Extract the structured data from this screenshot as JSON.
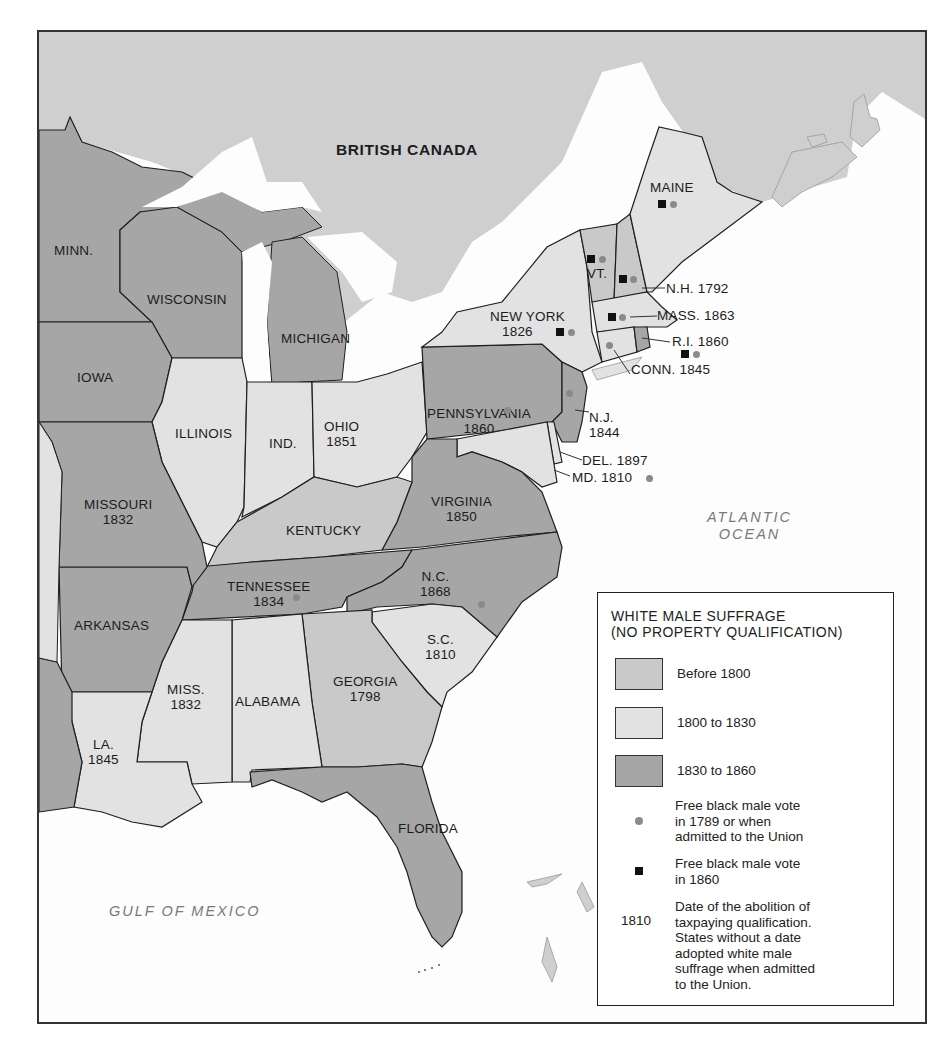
{
  "map": {
    "title": "White Male Suffrage in the United States",
    "colors": {
      "before_1800": "#c9c9c9",
      "1800_to_1830": "#e2e2e2",
      "1830_to_1860": "#a6a6a6",
      "canada": "#cfcfcf",
      "water": "#fdfdfd",
      "border": "#1f1f1f",
      "gray_dot": "#8a8a8a",
      "black_square": "#111111"
    },
    "regions": {
      "canada": "BRITISH CANADA",
      "atlantic_line1": "ATLANTIC",
      "atlantic_line2": "OCEAN",
      "gulf": "GULF OF MEXICO"
    },
    "states": [
      {
        "name": "MINN.",
        "year": "",
        "category": "1830 to 1860"
      },
      {
        "name": "WISCONSIN",
        "year": "",
        "category": "1830 to 1860"
      },
      {
        "name": "MICHIGAN",
        "year": "",
        "category": "1830 to 1860"
      },
      {
        "name": "IOWA",
        "year": "",
        "category": "1830 to 1860"
      },
      {
        "name": "ILLINOIS",
        "year": "",
        "category": "1800 to 1830"
      },
      {
        "name": "IND.",
        "year": "",
        "category": "1800 to 1830"
      },
      {
        "name": "OHIO",
        "year": "1851",
        "category": "1800 to 1830"
      },
      {
        "name": "MISSOURI",
        "year": "1832",
        "category": "1830 to 1860"
      },
      {
        "name": "KENTUCKY",
        "year": "",
        "category": "Before 1800"
      },
      {
        "name": "VIRGINIA",
        "year": "1850",
        "category": "1830 to 1860"
      },
      {
        "name": "ARKANSAS",
        "year": "",
        "category": "1830 to 1860"
      },
      {
        "name": "TENNESSEE",
        "year": "1834",
        "category": "1830 to 1860",
        "gray_dot": true
      },
      {
        "name": "N.C.",
        "year": "1868",
        "category": "1830 to 1860",
        "gray_dot": true
      },
      {
        "name": "S.C.",
        "year": "1810",
        "category": "1800 to 1830"
      },
      {
        "name": "GEORGIA",
        "year": "1798",
        "category": "Before 1800"
      },
      {
        "name": "ALABAMA",
        "year": "",
        "category": "1800 to 1830"
      },
      {
        "name": "MISS.",
        "year": "1832",
        "category": "1800 to 1830"
      },
      {
        "name": "LA.",
        "year": "1845",
        "category": "1800 to 1830"
      },
      {
        "name": "FLORIDA",
        "year": "",
        "category": "1830 to 1860"
      },
      {
        "name": "PENNSYLVANIA",
        "year": "1860",
        "category": "1830 to 1860",
        "gray_dot": true
      },
      {
        "name": "NEW YORK",
        "year": "1826",
        "category": "1800 to 1830",
        "gray_dot": true,
        "black_square": true
      },
      {
        "name": "N.J.",
        "year": "1844",
        "category": "1830 to 1860",
        "gray_dot": true
      },
      {
        "name": "DEL.",
        "year": "1897",
        "category": "1800 to 1830"
      },
      {
        "name": "MD.",
        "year": "1810",
        "category": "1800 to 1830",
        "gray_dot": true
      },
      {
        "name": "VT.",
        "year": "",
        "category": "Before 1800",
        "gray_dot": true,
        "black_square": true
      },
      {
        "name": "N.H.",
        "year": "1792",
        "category": "Before 1800",
        "gray_dot": true,
        "black_square": true
      },
      {
        "name": "MASS.",
        "year": "1863",
        "category": "1800 to 1830",
        "gray_dot": true,
        "black_square": true
      },
      {
        "name": "R.I.",
        "year": "1860",
        "category": "1830 to 1860",
        "gray_dot": true,
        "black_square": true
      },
      {
        "name": "CONN.",
        "year": "1845",
        "category": "1800 to 1830",
        "gray_dot": true
      },
      {
        "name": "MAINE",
        "year": "",
        "category": "1800 to 1830",
        "gray_dot": true,
        "black_square": true
      }
    ],
    "labels": {
      "minn": "MINN.",
      "wisconsin": "WISCONSIN",
      "michigan": "MICHIGAN",
      "iowa": "IOWA",
      "illinois": "ILLINOIS",
      "ind": "IND.",
      "ohio": "OHIO",
      "ohio_year": "1851",
      "missouri": "MISSOURI",
      "missouri_year": "1832",
      "kentucky": "KENTUCKY",
      "virginia": "VIRGINIA",
      "virginia_year": "1850",
      "arkansas": "ARKANSAS",
      "tennessee": "TENNESSEE",
      "tennessee_year": "1834",
      "nc": "N.C.",
      "nc_year": "1868",
      "sc": "S.C.",
      "sc_year": "1810",
      "georgia": "GEORGIA",
      "georgia_year": "1798",
      "alabama": "ALABAMA",
      "miss": "MISS.",
      "miss_year": "1832",
      "la": "LA.",
      "la_year": "1845",
      "florida": "FLORIDA",
      "pennsylvania": "PENNSYLVANIA",
      "pennsylvania_year": "1860",
      "new_york": "NEW YORK",
      "new_york_year": "1826",
      "nj": "N.J.",
      "nj_year": "1844",
      "del": "DEL. 1897",
      "md": "MD. 1810",
      "vt": "VT.",
      "nh": "N.H. 1792",
      "mass": "MASS. 1863",
      "ri": "R.I. 1860",
      "conn": "CONN. 1845",
      "maine": "MAINE"
    }
  },
  "legend": {
    "title_line1": "WHITE MALE SUFFRAGE",
    "title_line2": "(NO PROPERTY QUALIFICATION)",
    "items": [
      {
        "label": "Before 1800",
        "color": "#c9c9c9"
      },
      {
        "label": "1800 to 1830",
        "color": "#e2e2e2"
      },
      {
        "label": "1830 to 1860",
        "color": "#a6a6a6"
      }
    ],
    "gray_dot_line1": "Free black male vote",
    "gray_dot_line2": "in 1789 or when",
    "gray_dot_line3": "admitted to the Union",
    "black_square_line1": "Free black male vote",
    "black_square_line2": "in 1860",
    "year_example": "1810",
    "year_line1": "Date of the abolition of",
    "year_line2": "taxpaying qualification.",
    "year_line3": "States without a date",
    "year_line4": "adopted white male",
    "year_line5": "suffrage when admitted",
    "year_line6": "to the Union."
  }
}
